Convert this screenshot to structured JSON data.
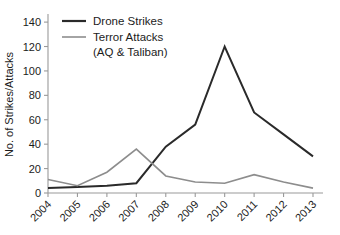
{
  "chart_data": {
    "type": "line",
    "title": "",
    "subtitle": "",
    "xlabel": "",
    "ylabel": "No. of Strikes/Attacks",
    "categories": [
      "2004",
      "2005",
      "2006",
      "2007",
      "2008",
      "2009",
      "2010",
      "2011",
      "2012",
      "2013"
    ],
    "x": [
      2004,
      2005,
      2006,
      2007,
      2008,
      2009,
      2010,
      2011,
      2012,
      2013
    ],
    "series": [
      {
        "name": "Drone Strikes",
        "color": "#2a2a2a",
        "line_width": 2.0,
        "values": [
          4,
          5,
          6,
          8,
          38,
          56,
          120,
          66,
          48,
          30
        ]
      },
      {
        "name": "Terror Attacks (AQ & Taliban)",
        "color": "#8d8d8d",
        "line_width": 1.6,
        "values": [
          11,
          6,
          17,
          36,
          14,
          9,
          8,
          15,
          9,
          4
        ]
      }
    ],
    "ylim": [
      0,
      145
    ],
    "yticks": [
      0,
      20,
      40,
      60,
      80,
      100,
      120,
      140
    ],
    "ytick_labels": [
      "0",
      "20",
      "40",
      "60",
      "80",
      "100",
      "120",
      "140"
    ],
    "xtick_labels": [
      "2004",
      "2005",
      "2006",
      "2007",
      "2008",
      "2009",
      "2010",
      "2011",
      "2012",
      "2013"
    ],
    "xtick_rotation": -45,
    "grid": false,
    "legend_position": "upper left",
    "legend": [
      {
        "label": "Drone Strikes",
        "color": "#2a2a2a"
      },
      {
        "label": "Terror Attacks",
        "color": "#8d8d8d"
      },
      {
        "label": "(AQ & Taliban)",
        "color": "#8d8d8d"
      }
    ],
    "axis_color": "#9a9a9a",
    "background": "#ffffff"
  }
}
